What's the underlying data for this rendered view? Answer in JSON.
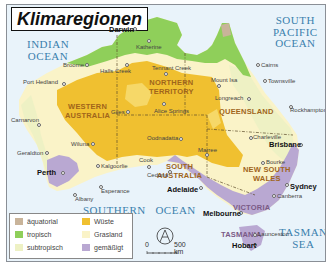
{
  "title": "Klimaregionen",
  "oceans": {
    "indian": "INDIAN OCEAN",
    "indian_l1": "INDIAN",
    "indian_l2": "OCEAN",
    "pacific_l1": "SOUTH",
    "pacific_l2": "PACIFIC",
    "pacific_l3": "OCEAN",
    "southern": "SOUTHERN OCEAN",
    "southern_l1": "SOUTHERN",
    "southern_l2": "OCEAN",
    "tasman_l1": "TASMAN",
    "tasman_l2": "SEA"
  },
  "states": {
    "wa_l1": "WESTERN",
    "wa_l2": "AUSTRALIA",
    "nt_l1": "NORTHERN",
    "nt_l2": "TERRITORY",
    "qld": "QUEENSLAND",
    "sa_l1": "SOUTH",
    "sa_l2": "AUSTRALIA",
    "nsw_l1": "NEW SOUTH",
    "nsw_l2": "WALES",
    "vic": "VICTORIA",
    "tas": "TASMANIA"
  },
  "cities": {
    "darwin": "Darwin",
    "katherine": "Katherine",
    "broome": "Broome",
    "halls_creek": "Halls Creek",
    "tennant_creek": "Tennant Creek",
    "port_hedland": "Port Hedland",
    "mount_isa": "Mount Isa",
    "cairns": "Cairns",
    "townsville": "Townsville",
    "longreach": "Longreach",
    "carnarvon": "Carnarvon",
    "giles": "Giles",
    "alice_springs": "Alice Springs",
    "rockhampton": "Rockhampton",
    "wiluna": "Wiluna",
    "oodnadatta": "Oodnadatta",
    "charleville": "Charleville",
    "brisbane": "Brisbane",
    "geraldton": "Geraldton",
    "kalgoorlie": "Kalgoorlie",
    "cook": "Cook",
    "marree": "Marree",
    "bourke": "Bourke",
    "ceduna": "Ceduna",
    "perth": "Perth",
    "esperance": "Esperance",
    "adelaide": "Adelaide",
    "sydney": "Sydney",
    "canberra": "Canberra",
    "albany": "Albany",
    "melbourne": "Melbourne",
    "launceston": "Launceston",
    "hobart": "Hobart"
  },
  "legend": {
    "items": [
      {
        "label": "äquatorial",
        "color": "#c9b49a"
      },
      {
        "label": "tropisch",
        "color": "#8fcf5a"
      },
      {
        "label": "subtropisch",
        "color": "#f1f2c4"
      },
      {
        "label": "Wüste",
        "color": "#f0c030"
      },
      {
        "label": "Grasland",
        "color": "#faf3c8"
      },
      {
        "label": "gemäßigt",
        "color": "#b9a8d2"
      }
    ]
  },
  "scale": {
    "zero": "0",
    "distance": "500 km"
  },
  "colors": {
    "sea": "#e9f3fa",
    "desert": "#f0c030",
    "grassland": "#faf3c8",
    "subtropical": "#eef1c4",
    "tropical": "#8fcf5a",
    "temperate": "#b9a8d2",
    "equatorial": "#c9b49a",
    "ocean_label": "#3a7fad"
  }
}
